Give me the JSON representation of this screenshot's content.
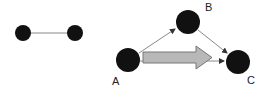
{
  "diagram": {
    "left_graph": {
      "nodes": [
        {
          "id": "left-node-1",
          "cx": 23,
          "cy": 33,
          "r": 8
        },
        {
          "id": "left-node-2",
          "cx": 75,
          "cy": 33,
          "r": 8
        }
      ],
      "edges": [
        {
          "from": "left-node-1",
          "to": "left-node-2",
          "directed": false
        }
      ]
    },
    "right_graph": {
      "nodes": [
        {
          "id": "A",
          "label": "A",
          "cx": 128,
          "cy": 60,
          "r": 12
        },
        {
          "id": "B",
          "label": "B",
          "cx": 188,
          "cy": 22,
          "r": 12
        },
        {
          "id": "C",
          "label": "C",
          "cx": 238,
          "cy": 62,
          "r": 12
        }
      ],
      "edges": [
        {
          "from": "A",
          "to": "B",
          "directed": true
        },
        {
          "from": "B",
          "to": "C",
          "directed": true
        },
        {
          "from": "A",
          "to": "C",
          "directed": true
        }
      ],
      "flow_arrow": {
        "from": "A",
        "to": "C",
        "color": "#b8b8b8"
      }
    },
    "labels": {
      "a": "A",
      "b": "B",
      "c": "C"
    },
    "colors": {
      "node": "#111111",
      "edge": "#888888",
      "arrow_fill": "#b8b8b8",
      "arrow_stroke": "#777777"
    }
  }
}
